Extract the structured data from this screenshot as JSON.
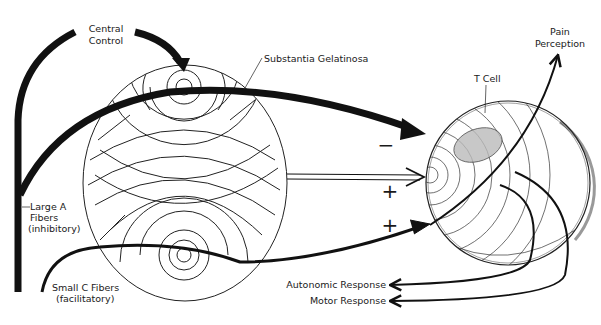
{
  "diagram": {
    "colors": {
      "ink": "#111111",
      "background": "#ffffff"
    },
    "labels": {
      "central_control": [
        "Central",
        "Control"
      ],
      "substantia_gelatinosa": "Substantia Gelatinosa",
      "t_cell": "T Cell",
      "pain_perception": [
        "Pain",
        "Perception"
      ],
      "large_a_fibers": [
        "Large A",
        "Fibers",
        "(inhibitory)"
      ],
      "small_c_fibers": [
        "Small C Fibers",
        "(facilitatory)"
      ],
      "autonomic_response": "Autonomic Response",
      "motor_response": "Motor Response"
    },
    "signs": {
      "large_a_to_t_cell": "−",
      "sg_to_t_cell": "+",
      "small_c_to_t_cell": "+"
    },
    "nodes": [
      {
        "id": "central-control",
        "label": "Central Control"
      },
      {
        "id": "substantia-gelatinosa",
        "label": "Substantia Gelatinosa"
      },
      {
        "id": "t-cell",
        "label": "T Cell"
      }
    ],
    "edges": [
      {
        "from": "large-a-fibers",
        "to": "central-control",
        "style": "thick"
      },
      {
        "from": "central-control",
        "to": "substantia-gelatinosa",
        "style": "thick-arrow"
      },
      {
        "from": "large-a-fibers",
        "to": "t-cell",
        "style": "thick-arrow",
        "sign": "−"
      },
      {
        "from": "substantia-gelatinosa",
        "to": "t-cell",
        "style": "double-line-arrow",
        "sign": "+"
      },
      {
        "from": "small-c-fibers",
        "to": "t-cell",
        "style": "arrow",
        "sign": "+"
      },
      {
        "from": "t-cell",
        "to": "pain-perception",
        "style": "arrow"
      },
      {
        "from": "t-cell",
        "to": "autonomic-response",
        "style": "arrow"
      },
      {
        "from": "t-cell",
        "to": "motor-response",
        "style": "arrow"
      }
    ]
  }
}
